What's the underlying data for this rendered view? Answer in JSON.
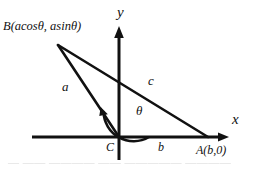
{
  "figure": {
    "stroke_color": "#111111",
    "background_color": "#ffffff",
    "axes": {
      "x_label": "x",
      "y_label": "y",
      "origin_label": "C"
    },
    "points": [
      {
        "name": "B",
        "label": "B(acosθ, asinθ)",
        "x": 57,
        "y": 44
      },
      {
        "name": "C",
        "label": "C",
        "x": 119,
        "y": 137
      },
      {
        "name": "A",
        "label": "A(b,0)",
        "x": 207,
        "y": 137
      }
    ],
    "sides": [
      {
        "name": "a",
        "label": "a",
        "from": "C",
        "to": "B"
      },
      {
        "name": "b",
        "label": "b",
        "from": "C",
        "to": "A"
      },
      {
        "name": "c",
        "label": "c",
        "from": "B",
        "to": "A"
      }
    ],
    "angle": {
      "label": "θ",
      "vertex": "C",
      "from_ray": "positive x-axis",
      "to_ray": "CB",
      "radius": 30
    },
    "bottom_cropped_text": "—   ——  ————  —— ————— ————"
  }
}
